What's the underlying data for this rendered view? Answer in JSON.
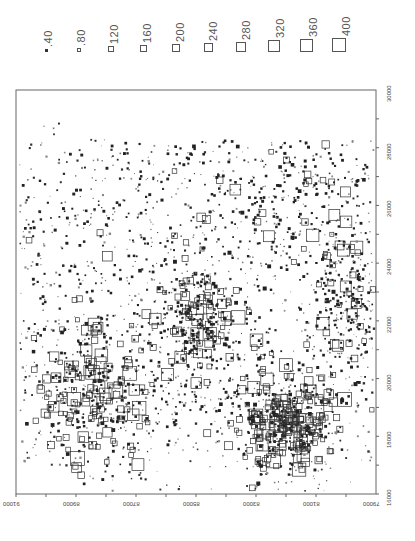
{
  "chart_data": {
    "type": "scatter",
    "subtype": "proportional-square-symbol map (rotated 90°)",
    "title": "",
    "legend": {
      "position": "top",
      "entries": [
        {
          "label": "40",
          "size": 40
        },
        {
          "label": "80",
          "size": 80
        },
        {
          "label": "120",
          "size": 120
        },
        {
          "label": "160",
          "size": 160
        },
        {
          "label": "200",
          "size": 200
        },
        {
          "label": "240",
          "size": 240
        },
        {
          "label": "280",
          "size": 280
        },
        {
          "label": "320",
          "size": 320
        },
        {
          "label": "360",
          "size": 360
        },
        {
          "label": "400",
          "size": 400
        }
      ]
    },
    "x_axis": {
      "side": "bottom",
      "orientation": "labels upside-down",
      "ticks": [
        "91000",
        "89000",
        "87000",
        "85000",
        "83000",
        "81000",
        "79000"
      ],
      "range": [
        91000,
        79000
      ]
    },
    "y_axis": {
      "side": "right",
      "orientation": "labels rotated",
      "ticks": [
        "16000",
        "18000",
        "20000",
        "22000",
        "24000",
        "26000",
        "28000",
        "30000"
      ],
      "range": [
        16000,
        30000
      ]
    },
    "grid": false,
    "clusters": [
      {
        "name": "dense-lower-center",
        "x_east": 18000,
        "y_north": 81500,
        "density": "very high",
        "max_size": 400
      },
      {
        "name": "lower-left-cluster",
        "x_east": 19500,
        "y_north": 88500,
        "density": "high",
        "max_size": 360
      },
      {
        "name": "center-cluster",
        "x_east": 22000,
        "y_north": 85500,
        "density": "high",
        "max_size": 280
      },
      {
        "name": "lower-right-cluster",
        "x_east": 24000,
        "y_north": 80000,
        "density": "high",
        "max_size": 240
      },
      {
        "name": "upper-band",
        "x_east": 26000,
        "y_north": 84000,
        "density": "medium",
        "max_size": 200
      },
      {
        "name": "sparse-top-left",
        "x_east": 27000,
        "y_north": 89500,
        "density": "low",
        "max_size": 160
      }
    ]
  }
}
